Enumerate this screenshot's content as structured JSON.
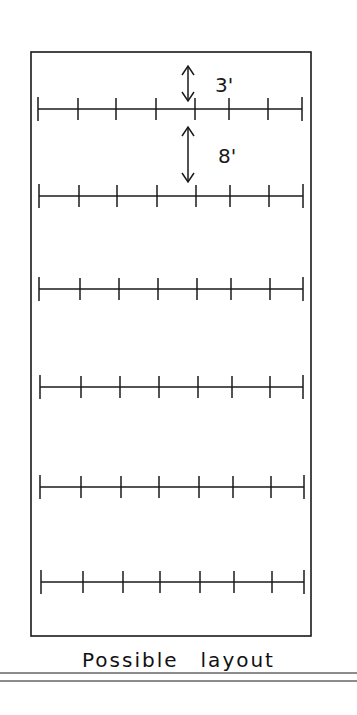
{
  "diagram": {
    "caption_words": [
      "Possible",
      "layout"
    ],
    "stroke_color": "#1a1a1a",
    "background": "#ffffff",
    "frame": {
      "x": 31,
      "y": 52,
      "width": 280,
      "height": 584
    },
    "rows": [
      {
        "y": 109,
        "x_start": 38,
        "x_end": 302,
        "ticks": [
          38,
          78,
          116,
          156,
          195,
          229,
          268,
          302
        ]
      },
      {
        "y": 196,
        "x_start": 39,
        "x_end": 303,
        "ticks": [
          39,
          79,
          117,
          157,
          196,
          230,
          269,
          303
        ]
      },
      {
        "y": 289,
        "x_start": 39,
        "x_end": 303,
        "ticks": [
          39,
          80,
          119,
          158,
          197,
          231,
          270,
          303
        ]
      },
      {
        "y": 387,
        "x_start": 40,
        "x_end": 303,
        "ticks": [
          40,
          81,
          120,
          159,
          198,
          232,
          270,
          303
        ]
      },
      {
        "y": 487,
        "x_start": 40,
        "x_end": 304,
        "ticks": [
          40,
          81,
          121,
          159,
          199,
          233,
          271,
          304
        ]
      },
      {
        "y": 582,
        "x_start": 41,
        "x_end": 304,
        "ticks": [
          41,
          83,
          123,
          160,
          200,
          234,
          272,
          304
        ]
      }
    ],
    "dimensions": [
      {
        "label": "3'",
        "meaning": "row spacing between planting positions",
        "x": 188,
        "y1": 66,
        "y2": 101,
        "label_x": 215,
        "label_y": 92
      },
      {
        "label": "8'",
        "meaning": "spacing between rows",
        "x": 188,
        "y1": 127,
        "y2": 182,
        "label_x": 218,
        "label_y": 163
      }
    ],
    "underlines": [
      {
        "y": 673
      },
      {
        "y": 681
      }
    ]
  }
}
